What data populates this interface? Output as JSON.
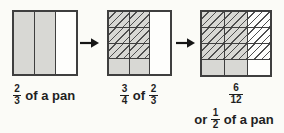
{
  "colors": {
    "background": "#fbfbf7",
    "shaded": "#d8d8d4",
    "white": "#fefefc",
    "grid_line": "#3f3f3f",
    "hatch_line": "#4f4f4f",
    "arrow": "#151515",
    "text": "#1f1f1f"
  },
  "panels": [
    {
      "name": "two-thirds-model",
      "columns": [
        {
          "rows": 1,
          "fill": "shaded",
          "hatched_rows": []
        },
        {
          "rows": 1,
          "fill": "shaded",
          "hatched_rows": []
        },
        {
          "rows": 1,
          "fill": "white",
          "hatched_rows": []
        }
      ]
    },
    {
      "name": "three-fourths-of-two-thirds-model",
      "columns": [
        {
          "rows": 4,
          "fill": "shaded",
          "hatched_rows": [
            0,
            1,
            2
          ]
        },
        {
          "rows": 4,
          "fill": "shaded",
          "hatched_rows": [
            0,
            1,
            2
          ]
        },
        {
          "rows": 1,
          "fill": "white",
          "hatched_rows": []
        }
      ]
    },
    {
      "name": "six-twelfths-model",
      "columns": [
        {
          "rows": 4,
          "fill": "shaded",
          "hatched_rows": [
            0,
            1,
            2
          ]
        },
        {
          "rows": 4,
          "fill": "shaded",
          "hatched_rows": [
            0,
            1,
            2
          ]
        },
        {
          "rows": 4,
          "fill": "white",
          "hatched_rows": [
            0,
            1,
            2
          ]
        }
      ]
    }
  ],
  "labels": {
    "first": {
      "fraction": {
        "num": "2",
        "den": "3"
      },
      "suffix": "of a pan"
    },
    "second": {
      "fraction1": {
        "num": "3",
        "den": "4"
      },
      "middle": "of",
      "fraction2": {
        "num": "2",
        "den": "3"
      }
    },
    "third": {
      "fraction": {
        "num": "6",
        "den": "12"
      }
    },
    "fourth": {
      "prefix": "or",
      "fraction": {
        "num": "1",
        "den": "2"
      },
      "suffix": "of a pan"
    }
  }
}
